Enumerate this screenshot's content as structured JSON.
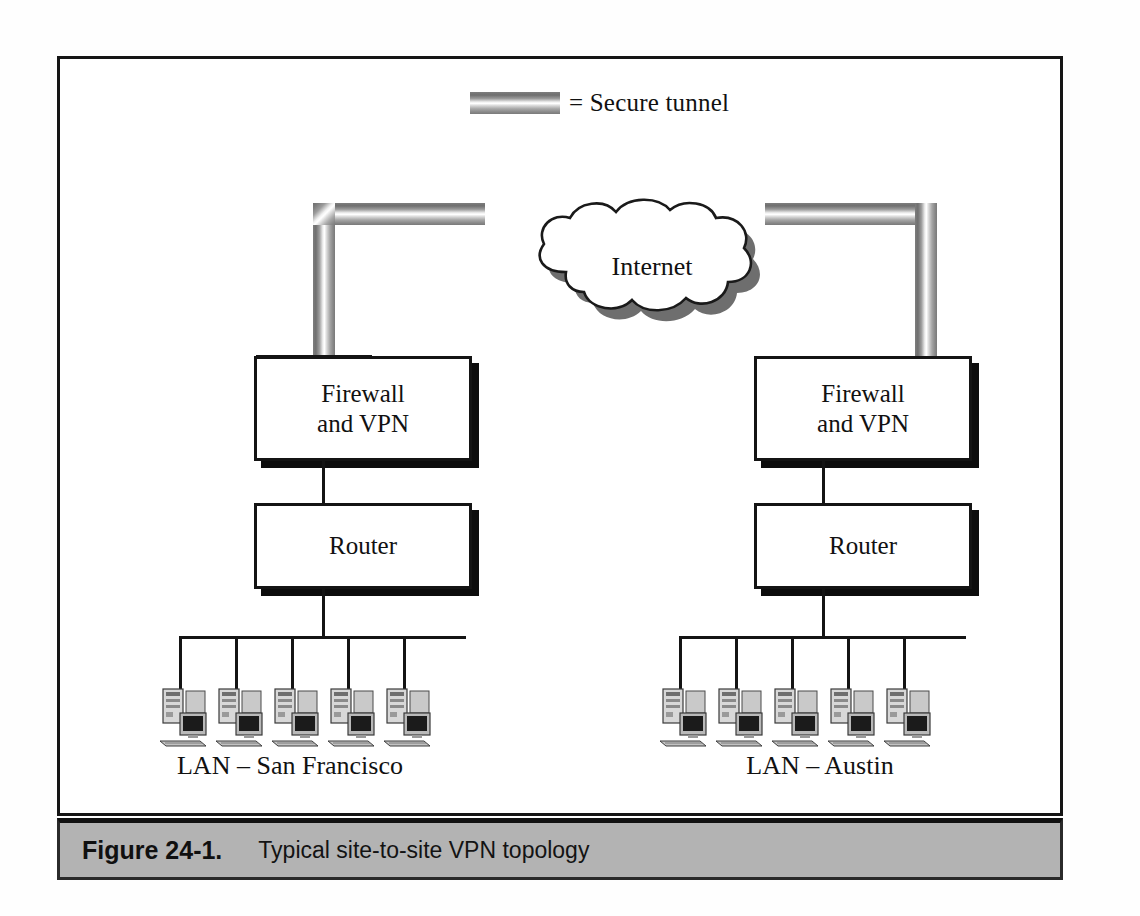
{
  "figure": {
    "caption_number": "Figure 24-1.",
    "caption_text": "Typical site-to-site VPN topology"
  },
  "legend": {
    "swatch_name": "secure-tunnel-gradient",
    "text": "= Secure tunnel"
  },
  "cloud": {
    "label": "Internet"
  },
  "sites": [
    {
      "id": "san-francisco",
      "firewall_label": "Firewall\nand VPN",
      "firewall_line1": "Firewall",
      "firewall_line2": "and VPN",
      "router_label": "Router",
      "lan_label": "LAN – San Francisco",
      "host_count": 5
    },
    {
      "id": "austin",
      "firewall_label": "Firewall\nand VPN",
      "firewall_line1": "Firewall",
      "firewall_line2": "and VPN",
      "router_label": "Router",
      "lan_label": "LAN – Austin",
      "host_count": 5
    }
  ],
  "colors": {
    "frame_border": "#151515",
    "box_border": "#141414",
    "box_shadow": "#0d0d0d",
    "wire": "#141414",
    "caption_bar_bg": "#b3b3b3",
    "caption_bar_border": "#111111",
    "pipe_dark": "#7a7a7a",
    "pipe_light": "#ffffff",
    "page_bg": "#ffffff"
  }
}
